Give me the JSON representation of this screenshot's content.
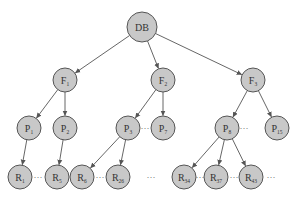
{
  "diagram": {
    "type": "tree",
    "colors": {
      "node_fill": "#c8c8c8",
      "node_stroke": "#555555",
      "edge": "#555555",
      "text": "#333333"
    },
    "nodes": [
      {
        "id": "DB",
        "label": "DB",
        "sub": "",
        "x": 142,
        "y": 27,
        "r": 15
      },
      {
        "id": "F1",
        "label": "F",
        "sub": "1",
        "x": 65,
        "y": 80,
        "r": 12
      },
      {
        "id": "F2",
        "label": "F",
        "sub": "2",
        "x": 163,
        "y": 80,
        "r": 12
      },
      {
        "id": "F3",
        "label": "F",
        "sub": "3",
        "x": 253,
        "y": 80,
        "r": 12
      },
      {
        "id": "P1",
        "label": "P",
        "sub": "1",
        "x": 29,
        "y": 128,
        "r": 12
      },
      {
        "id": "P2",
        "label": "P",
        "sub": "2",
        "x": 65,
        "y": 128,
        "r": 12
      },
      {
        "id": "P3",
        "label": "P",
        "sub": "3",
        "x": 128,
        "y": 128,
        "r": 12
      },
      {
        "id": "P7",
        "label": "P",
        "sub": "7",
        "x": 163,
        "y": 128,
        "r": 12
      },
      {
        "id": "P8",
        "label": "P",
        "sub": "8",
        "x": 227,
        "y": 128,
        "r": 12
      },
      {
        "id": "P15",
        "label": "P",
        "sub": "15",
        "x": 277,
        "y": 128,
        "r": 12
      },
      {
        "id": "R1",
        "label": "R",
        "sub": "1",
        "x": 20,
        "y": 177,
        "r": 12
      },
      {
        "id": "R5",
        "label": "R",
        "sub": "5",
        "x": 57,
        "y": 177,
        "r": 12
      },
      {
        "id": "R6",
        "label": "R",
        "sub": "6",
        "x": 82,
        "y": 177,
        "r": 12
      },
      {
        "id": "R26",
        "label": "R",
        "sub": "26",
        "x": 118,
        "y": 177,
        "r": 12
      },
      {
        "id": "R34",
        "label": "R",
        "sub": "34",
        "x": 184,
        "y": 177,
        "r": 12
      },
      {
        "id": "R37",
        "label": "R",
        "sub": "37",
        "x": 216,
        "y": 177,
        "r": 12
      },
      {
        "id": "R43",
        "label": "R",
        "sub": "43",
        "x": 251,
        "y": 177,
        "r": 12
      }
    ],
    "edges": [
      {
        "from": "DB",
        "to": "F1"
      },
      {
        "from": "DB",
        "to": "F2"
      },
      {
        "from": "DB",
        "to": "F3"
      },
      {
        "from": "F1",
        "to": "P1"
      },
      {
        "from": "F1",
        "to": "P2"
      },
      {
        "from": "F2",
        "to": "P3"
      },
      {
        "from": "F2",
        "to": "P7"
      },
      {
        "from": "F3",
        "to": "P8"
      },
      {
        "from": "F3",
        "to": "P15"
      },
      {
        "from": "P1",
        "to": "R1"
      },
      {
        "from": "P2",
        "to": "R5"
      },
      {
        "from": "P3",
        "to": "R6"
      },
      {
        "from": "P3",
        "to": "R26"
      },
      {
        "from": "P8",
        "to": "R34"
      },
      {
        "from": "P8",
        "to": "R37"
      },
      {
        "from": "P8",
        "to": "R43"
      }
    ],
    "ellipses": [
      {
        "x": 145,
        "y": 131,
        "text": "···"
      },
      {
        "x": 244,
        "y": 131,
        "text": "···"
      },
      {
        "x": 38,
        "y": 180,
        "text": "···"
      },
      {
        "x": 100,
        "y": 180,
        "text": "···"
      },
      {
        "x": 151,
        "y": 180,
        "text": "···"
      },
      {
        "x": 200,
        "y": 180,
        "text": "···"
      },
      {
        "x": 234,
        "y": 180,
        "text": "···"
      },
      {
        "x": 271,
        "y": 180,
        "text": "···"
      }
    ]
  }
}
